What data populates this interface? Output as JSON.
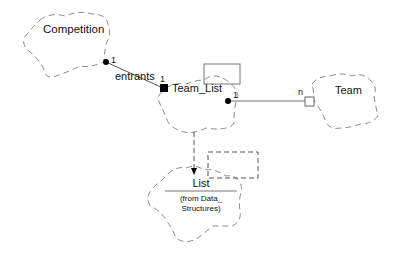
{
  "diagram": {
    "type": "UML class diagram (Booch cloud notation)",
    "classes": [
      {
        "id": "competition",
        "name": "Competition"
      },
      {
        "id": "team_list",
        "name": "Team_List"
      },
      {
        "id": "team",
        "name": "Team"
      },
      {
        "id": "list",
        "name": "List",
        "subtitle": "(from Data_ Structures)",
        "subtitle_line1": "(from Data_",
        "subtitle_line2": "Structures)"
      }
    ],
    "relations": [
      {
        "from": "competition",
        "to": "team_list",
        "kind": "has-by-value",
        "role": "entrants",
        "from_mult": "1",
        "to_mult": "1"
      },
      {
        "from": "team_list",
        "to": "team",
        "kind": "has-by-reference",
        "from_mult": "1",
        "to_mult": "n"
      },
      {
        "from": "team_list",
        "to": "list",
        "kind": "instantiates (dashed)"
      }
    ],
    "labels": {
      "competition": "Competition",
      "entrants": "entrants",
      "mult_comp": "1",
      "mult_teamlist_left": "1",
      "team_list": "Team_List",
      "mult_teamlist_right": "1",
      "mult_team": "n",
      "team": "Team",
      "list": "List",
      "list_from1": "(from Data_",
      "list_from2": "Structures)"
    }
  }
}
